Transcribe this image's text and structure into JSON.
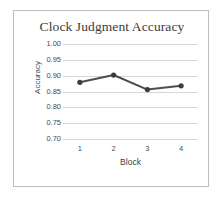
{
  "chart_data": {
    "type": "line",
    "title": "Clock Judgment Accuracy",
    "xlabel": "Block",
    "ylabel": "Accuracy",
    "categories": [
      "1",
      "2",
      "3",
      "4"
    ],
    "values": [
      0.879,
      0.902,
      0.856,
      0.868
    ],
    "series": [
      {
        "name": "Accuracy",
        "values": [
          0.879,
          0.902,
          0.856,
          0.868
        ]
      }
    ],
    "ylim": [
      0.7,
      1.0
    ],
    "y_ticks": [
      1.0,
      0.95,
      0.9,
      0.85,
      0.8,
      0.75,
      0.7
    ],
    "y_tick_labels": [
      "1.00",
      "0.95",
      "0.90",
      "0.85",
      "0.80",
      "0.75",
      "0.70"
    ],
    "x_ticks": [
      1,
      2,
      3,
      4
    ],
    "x_tick_labels": [
      "1",
      "2",
      "3",
      "4"
    ],
    "grid": "horizontal",
    "legend": "none",
    "line_color": "#4d4d4d",
    "marker_color": "#3d3d3d",
    "grid_color": "#d6d6d6",
    "text_color": "#4a4a4a",
    "frame_color": "#bdbdbd"
  }
}
